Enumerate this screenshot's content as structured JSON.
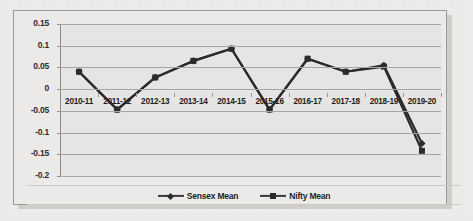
{
  "chart_data": {
    "type": "line",
    "title": "",
    "xlabel": "",
    "ylabel": "",
    "categories": [
      "2010-11",
      "2011-12",
      "2012-13",
      "2013-14",
      "2014-15",
      "2015-16",
      "2016-17",
      "2017-18",
      "2018-19",
      "2019-20"
    ],
    "series": [
      {
        "name": "Sensex Mean",
        "marker": "diamond",
        "color": "#2b2b2b",
        "values": [
          0.04,
          -0.047,
          0.027,
          0.065,
          0.093,
          -0.047,
          0.07,
          0.04,
          0.055,
          -0.125
        ]
      },
      {
        "name": "Nifty Mean",
        "marker": "square",
        "color": "#2b2b2b",
        "values": [
          0.04,
          -0.047,
          0.027,
          0.065,
          0.093,
          -0.047,
          0.07,
          0.04,
          0.052,
          -0.142
        ]
      }
    ],
    "ylim": [
      -0.2,
      0.15
    ],
    "ytick_values": [
      0.15,
      0.1,
      0.05,
      0,
      -0.05,
      -0.1,
      -0.15,
      -0.2
    ],
    "ytick_labels": [
      "0.15",
      "0.1",
      "0.05",
      "0",
      "-0.05",
      "-0.1",
      "-0.15",
      "-0.2"
    ],
    "grid": "horizontal",
    "legend_position": "bottom-center",
    "plot_background": "#e6e5e3",
    "gridline_color": "#a8a6a4"
  }
}
